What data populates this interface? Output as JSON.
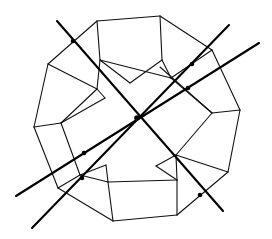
{
  "diagram": {
    "title": "",
    "colors": {
      "edge": "#111111",
      "axis": "#000000",
      "background": "#ffffff"
    },
    "vertices": {
      "O1": [
        97,
        21
      ],
      "O2": [
        160,
        16
      ],
      "O3": [
        212,
        50
      ],
      "O4": [
        240,
        110
      ],
      "O5": [
        228,
        172
      ],
      "O6": [
        177,
        215
      ],
      "O7": [
        113,
        221
      ],
      "O8": [
        58,
        188
      ],
      "O9": [
        34,
        127
      ],
      "O10": [
        48,
        64
      ],
      "A1": [
        100,
        60
      ],
      "A2": [
        162,
        60
      ],
      "A3": [
        171,
        78
      ],
      "A4": [
        212,
        113
      ],
      "A5": [
        176,
        155
      ],
      "A6": [
        177,
        180
      ],
      "A7": [
        108,
        182
      ],
      "A8": [
        80,
        175
      ],
      "A9": [
        61,
        123
      ],
      "A10": [
        97,
        89
      ],
      "B1": [
        130,
        83
      ],
      "B2": [
        106,
        165
      ],
      "B3": [
        105,
        98
      ],
      "B4": [
        156,
        166
      ],
      "B5": [
        160,
        67
      ]
    },
    "edges": [
      [
        "O1",
        "O2"
      ],
      [
        "O2",
        "O3"
      ],
      [
        "O3",
        "O4"
      ],
      [
        "O4",
        "O5"
      ],
      [
        "O5",
        "O6"
      ],
      [
        "O6",
        "O7"
      ],
      [
        "O7",
        "O8"
      ],
      [
        "O8",
        "O9"
      ],
      [
        "O9",
        "O10"
      ],
      [
        "O10",
        "O1"
      ],
      [
        "O1",
        "A1"
      ],
      [
        "O2",
        "A2"
      ],
      [
        "O3",
        "A3"
      ],
      [
        "O4",
        "A4"
      ],
      [
        "O5",
        "A5"
      ],
      [
        "O6",
        "A6"
      ],
      [
        "O7",
        "A7"
      ],
      [
        "O8",
        "A8"
      ],
      [
        "O9",
        "A9"
      ],
      [
        "O10",
        "A10"
      ],
      [
        "A1",
        "A3"
      ],
      [
        "A1",
        "B1"
      ],
      [
        "A2",
        "A3"
      ],
      [
        "A2",
        "B1"
      ],
      [
        "A3",
        "A4"
      ],
      [
        "A4",
        "A5"
      ],
      [
        "A5",
        "A6"
      ],
      [
        "A6",
        "A7"
      ],
      [
        "A7",
        "A8"
      ],
      [
        "A8",
        "A9"
      ],
      [
        "A9",
        "A10"
      ],
      [
        "A10",
        "A1"
      ],
      [
        "A10",
        "B3"
      ],
      [
        "A9",
        "B3"
      ],
      [
        "A7",
        "B2"
      ],
      [
        "A8",
        "B2"
      ],
      [
        "A5",
        "B4"
      ],
      [
        "A6",
        "B4"
      ],
      [
        "A4",
        "B5"
      ]
    ],
    "axes": [
      {
        "name": "axis-2fold",
        "from": [
          57,
          21
        ],
        "to": [
          223,
          211
        ]
      },
      {
        "name": "axis-3fold",
        "from": [
          32,
          228
        ],
        "to": [
          229,
          25
        ]
      },
      {
        "name": "axis-5fold",
        "from": [
          16,
          196
        ],
        "to": [
          259,
          43
        ]
      }
    ],
    "points": [
      {
        "name": "center",
        "at": [
          137,
          118
        ]
      },
      {
        "name": "axis-2fold-upper",
        "at": [
          73,
          41
        ]
      },
      {
        "name": "axis-2fold-lower",
        "at": [
          200,
          195
        ]
      },
      {
        "name": "axis-3fold-upper",
        "at": [
          192,
          64
        ]
      },
      {
        "name": "axis-3fold-lower",
        "at": [
          82,
          178
        ]
      },
      {
        "name": "axis-5fold-upper",
        "at": [
          188,
          88
        ]
      },
      {
        "name": "axis-5fold-lower",
        "at": [
          84,
          153
        ]
      }
    ]
  }
}
